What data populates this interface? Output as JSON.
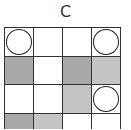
{
  "title": "C",
  "colors": {
    "dark": "#a9a9a9",
    "light": "#c4c4c4",
    "white": "#ffffff"
  },
  "grid": {
    "rows": [
      [
        {
          "fill": "white",
          "circle": true
        },
        {
          "fill": "white",
          "circle": false
        },
        {
          "fill": "white",
          "circle": false
        },
        {
          "fill": "white",
          "circle": true
        }
      ],
      [
        {
          "fill": "dark",
          "circle": false
        },
        {
          "fill": "white",
          "circle": false
        },
        {
          "fill": "dark",
          "circle": false
        },
        {
          "fill": "light",
          "circle": false
        }
      ],
      [
        {
          "fill": "white",
          "circle": false
        },
        {
          "fill": "white",
          "circle": false
        },
        {
          "fill": "light",
          "circle": false
        },
        {
          "fill": "white",
          "circle": true
        }
      ],
      [
        {
          "fill": "dark",
          "circle": false
        },
        {
          "fill": "light",
          "circle": false
        },
        {
          "fill": "white",
          "circle": false
        },
        {
          "fill": "white",
          "circle": false
        }
      ]
    ]
  }
}
